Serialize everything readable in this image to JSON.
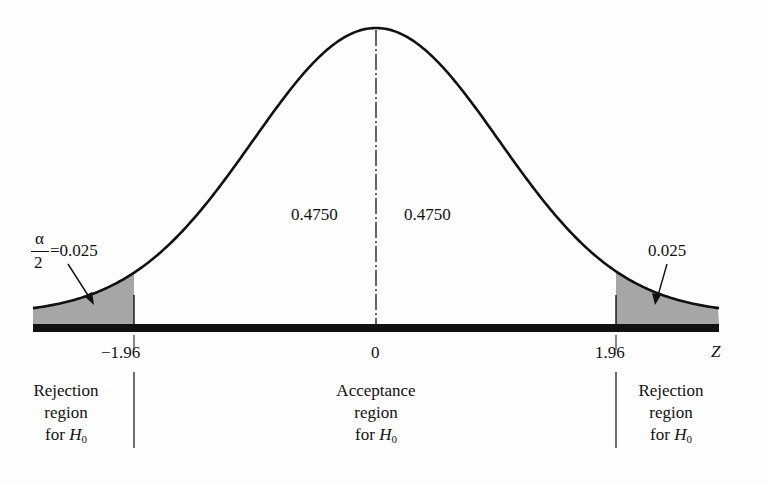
{
  "chart_data": {
    "type": "area",
    "title": "",
    "xlabel": "Z",
    "ylabel": "",
    "x_ticks": [
      -1.96,
      0,
      1.96
    ],
    "x_tick_labels": [
      "−1.96",
      "0",
      "1.96"
    ],
    "critical_values": [
      -1.96,
      1.96
    ],
    "areas": [
      {
        "region": "left tail",
        "range": [
          "-inf",
          -1.96
        ],
        "value": 0.025,
        "shaded": true,
        "label": "α/2 = 0.025"
      },
      {
        "region": "left center",
        "range": [
          -1.96,
          0
        ],
        "value": 0.475,
        "shaded": false,
        "label": "0.4750"
      },
      {
        "region": "right center",
        "range": [
          0,
          1.96
        ],
        "value": 0.475,
        "shaded": false,
        "label": "0.4750"
      },
      {
        "region": "right tail",
        "range": [
          1.96,
          "inf"
        ],
        "value": 0.025,
        "shaded": true,
        "label": "0.025"
      }
    ],
    "regions": [
      {
        "name": "Rejection region for H0",
        "range": [
          "-inf",
          -1.96
        ]
      },
      {
        "name": "Acceptance region for H0",
        "range": [
          -1.96,
          1.96
        ]
      },
      {
        "name": "Rejection region for H0",
        "range": [
          1.96,
          "inf"
        ]
      }
    ],
    "xlim": [
      -3.5,
      3.5
    ]
  },
  "labels": {
    "left_tail_numerator": "α",
    "left_tail_denominator": "2",
    "left_tail_value": "=0.025",
    "right_tail_value": "0.025",
    "center_left_area": "0.4750",
    "center_right_area": "0.4750",
    "tick_neg": "−1.96",
    "tick_zero": "0",
    "tick_pos": "1.96",
    "axis_var": "Z",
    "left_region": {
      "line1": "Rejection",
      "line2": "region",
      "line3": "for ",
      "h": "H",
      "sub": "0"
    },
    "center_region": {
      "line1": "Acceptance",
      "line2": "region",
      "line3": "for ",
      "h": "H",
      "sub": "0"
    },
    "right_region": {
      "line1": "Rejection",
      "line2": "region",
      "line3": "for ",
      "h": "H",
      "sub": "0"
    }
  },
  "colors": {
    "shade": "#a6a6a6",
    "ink": "#111111"
  }
}
